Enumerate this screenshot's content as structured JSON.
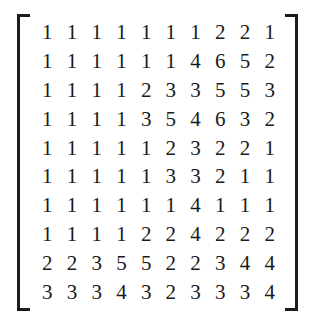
{
  "figure": {
    "kind": "matrix",
    "label": "integer-matrix",
    "rows": 10,
    "cols": 10,
    "bracket_style": "square",
    "text_color": "#1a1a1a",
    "background_color": "#ffffff"
  },
  "matrix": {
    "values": [
      [
        1,
        1,
        1,
        1,
        1,
        1,
        1,
        2,
        2,
        1
      ],
      [
        1,
        1,
        1,
        1,
        1,
        1,
        4,
        6,
        5,
        2
      ],
      [
        1,
        1,
        1,
        1,
        2,
        3,
        3,
        5,
        5,
        3
      ],
      [
        1,
        1,
        1,
        1,
        3,
        5,
        4,
        6,
        3,
        2
      ],
      [
        1,
        1,
        1,
        1,
        1,
        2,
        3,
        2,
        2,
        1
      ],
      [
        1,
        1,
        1,
        1,
        1,
        3,
        3,
        2,
        1,
        1
      ],
      [
        1,
        1,
        1,
        1,
        1,
        1,
        4,
        1,
        1,
        1
      ],
      [
        1,
        1,
        1,
        1,
        2,
        2,
        4,
        2,
        2,
        2
      ],
      [
        2,
        2,
        3,
        5,
        5,
        2,
        2,
        3,
        4,
        4
      ],
      [
        3,
        3,
        3,
        4,
        3,
        2,
        3,
        3,
        3,
        4
      ]
    ]
  }
}
